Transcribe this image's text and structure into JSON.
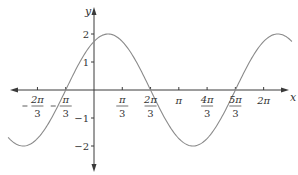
{
  "chart_data": {
    "type": "line",
    "title": "",
    "function": "y = 2 sin(x + π/3)",
    "amplitude": 2,
    "phase_shift_rad": 1.0471975512,
    "xlabel": "x",
    "ylabel": "y",
    "xlim_rad": [
      -3.18,
      7.33
    ],
    "ylim": [
      -2,
      2
    ],
    "grid": false,
    "legend": null,
    "x_ticks": [
      {
        "value": -2.0943951,
        "num": "2π",
        "den": "3",
        "neg": true
      },
      {
        "value": -1.0471976,
        "num": "π",
        "den": "3",
        "neg": true
      },
      {
        "value": 1.0471976,
        "num": "π",
        "den": "3",
        "neg": false
      },
      {
        "value": 2.0943951,
        "num": "2π",
        "den": "3",
        "neg": false
      },
      {
        "value": 3.1415927,
        "label": "π"
      },
      {
        "value": 4.1887902,
        "num": "4π",
        "den": "3",
        "neg": false
      },
      {
        "value": 5.2359878,
        "num": "5π",
        "den": "3",
        "neg": false
      },
      {
        "value": 6.2831853,
        "label": "2π"
      }
    ],
    "y_ticks": [
      {
        "value": 2,
        "label": "2"
      },
      {
        "value": 1,
        "label": "1"
      },
      {
        "value": -1,
        "label": "−1"
      },
      {
        "value": -2,
        "label": "−2"
      }
    ],
    "key_points": [
      {
        "x": "-5π/6",
        "y": -2
      },
      {
        "x": "-π/3",
        "y": 0
      },
      {
        "x": "0",
        "y": 1.732
      },
      {
        "x": "π/6",
        "y": 2
      },
      {
        "x": "2π/3",
        "y": 0
      },
      {
        "x": "7π/6",
        "y": -2
      },
      {
        "x": "5π/3",
        "y": 0
      },
      {
        "x": "13π/6",
        "y": 2
      }
    ],
    "colors": {
      "curve": "#8a8a8a",
      "axes": "#3a3a3a",
      "text": "#333333"
    }
  },
  "layout": {
    "origin_px": [
      94,
      90
    ],
    "px_per_rad": 27.0,
    "px_per_unit_y": 28,
    "x_axis_px": [
      10,
      289
    ],
    "y_axis_px": [
      7,
      172
    ]
  }
}
